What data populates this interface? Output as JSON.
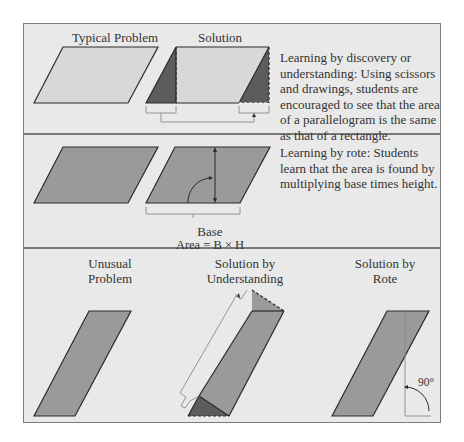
{
  "panel1": {
    "title_left": "Typical Problem",
    "title_right": "Solution",
    "description": "Learning by discovery or understanding:  Using scissors and drawings, students are encouraged to see that the area of a parallelogram is the same as that of a rectangle."
  },
  "panel2": {
    "height_label": "Height",
    "angle_label": "90°",
    "base_label": "Base",
    "area_formula": "Area = B × H",
    "description": "Learning by rote: Students learn that the area is found by multiplying base times height."
  },
  "panel3": {
    "col1_title_line1": "Unusual",
    "col1_title_line2": "Problem",
    "col2_title_line1": "Solution by",
    "col2_title_line2": "Understanding",
    "col3_title_line1": "Solution by",
    "col3_title_line2": "Rote",
    "angle_label": "90°"
  },
  "colors": {
    "background": "#e9e9e9",
    "light_fill": "#d8d8d8",
    "medium_fill": "#9a9a9a",
    "dark_fill": "#5c5c5c",
    "stroke": "#2a2a2a",
    "frame": "#7a7a7a"
  }
}
